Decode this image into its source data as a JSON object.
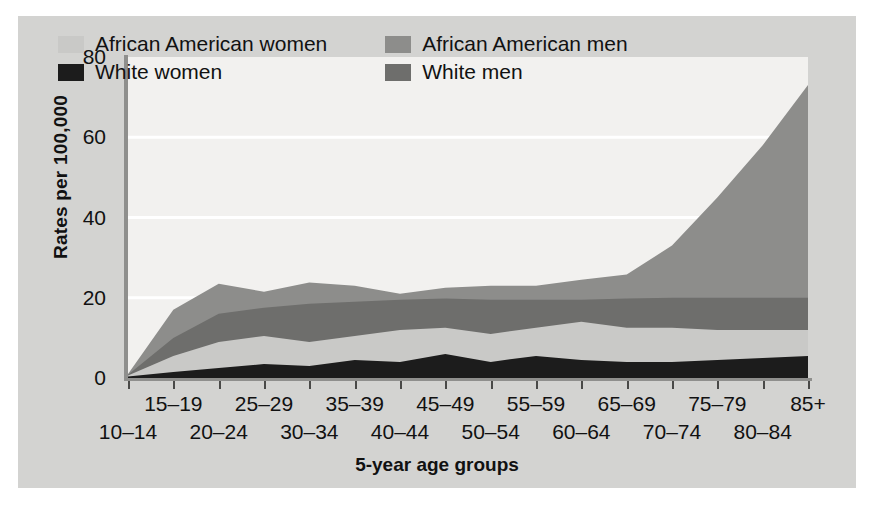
{
  "axes": {
    "ylabel": "Rates per 100,000",
    "xlabel": "5-year age groups",
    "yticks": [
      "0",
      "20",
      "40",
      "60",
      "80"
    ]
  },
  "legend": {
    "items": [
      {
        "label": "African American women",
        "color": "#c9c9c7"
      },
      {
        "label": "African American men",
        "color": "#8d8d8b"
      },
      {
        "label": "White women",
        "color": "#1c1c1c"
      },
      {
        "label": "White men",
        "color": "#6e6e6c"
      }
    ]
  },
  "chart_data": {
    "type": "area",
    "title": "",
    "xlabel": "5-year age groups",
    "ylabel": "Rates per 100,000",
    "ylim": [
      0,
      80
    ],
    "grid": true,
    "legend_position": "top-left",
    "categories": [
      "10–14",
      "15–19",
      "20–24",
      "25–29",
      "30–34",
      "35–39",
      "40–44",
      "45–49",
      "50–54",
      "55–59",
      "60–64",
      "65–69",
      "70–74",
      "75–79",
      "80–84",
      "85+"
    ],
    "series": [
      {
        "name": "African American men",
        "color": "#8d8d8b",
        "values": [
          1.0,
          17.0,
          23.5,
          21.5,
          23.8,
          23.0,
          21.0,
          22.5,
          23.0,
          23.0,
          24.5,
          25.8,
          33.0,
          45.0,
          58.0,
          73.0
        ]
      },
      {
        "name": "White men",
        "color": "#6e6e6c",
        "values": [
          0.8,
          10.0,
          16.0,
          17.5,
          18.5,
          19.0,
          19.5,
          19.8,
          19.5,
          19.5,
          19.5,
          19.8,
          20.0,
          20.0,
          20.0,
          20.0
        ]
      },
      {
        "name": "African American women",
        "color": "#c9c9c7",
        "values": [
          0.6,
          5.5,
          9.0,
          10.5,
          9.0,
          10.5,
          12.0,
          12.5,
          11.0,
          12.5,
          14.0,
          12.5,
          12.5,
          12.0,
          12.0,
          12.0
        ]
      },
      {
        "name": "White women",
        "color": "#1c1c1c",
        "values": [
          0.4,
          1.5,
          2.5,
          3.5,
          3.0,
          4.5,
          4.0,
          6.0,
          4.0,
          5.5,
          4.5,
          4.0,
          4.0,
          4.5,
          5.0,
          5.5
        ]
      }
    ]
  }
}
